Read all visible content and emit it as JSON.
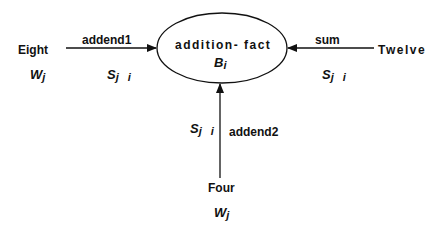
{
  "diagram": {
    "central_node": {
      "label": "addition- fact",
      "bias_symbol": "B",
      "bias_subscript": "i"
    },
    "input_nodes": [
      {
        "id": "left",
        "label": "Eight",
        "weight_symbol": "W",
        "weight_subscript": "j",
        "link_label": "addend1",
        "strength_symbol": "S",
        "strength_subscript": "j i"
      },
      {
        "id": "right",
        "label": "Twelve",
        "link_label": "sum",
        "strength_symbol": "S",
        "strength_subscript": "j i"
      },
      {
        "id": "bottom",
        "label": "Four",
        "weight_symbol": "W",
        "weight_subscript": "j",
        "link_label": "addend2",
        "strength_symbol": "S",
        "strength_subscript": "j i"
      }
    ],
    "colors": {
      "stroke": "#111111",
      "background": "#ffffff"
    }
  }
}
